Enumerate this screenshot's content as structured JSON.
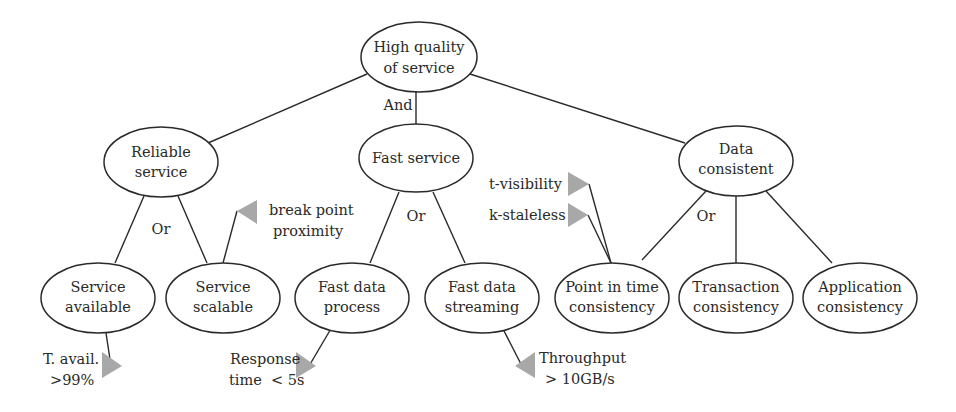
{
  "diagram": {
    "colors": {
      "stroke": "#2a2a2a",
      "flag": "#a8a8a8",
      "background": "#ffffff"
    },
    "nodes": {
      "root": {
        "lines": [
          "High quality",
          "of service"
        ]
      },
      "reliable": {
        "lines": [
          "Reliable",
          "service"
        ]
      },
      "fast": {
        "lines": [
          "Fast service"
        ]
      },
      "data": {
        "lines": [
          "Data",
          "consistent"
        ]
      },
      "available": {
        "lines": [
          "Service",
          "available"
        ]
      },
      "scalable": {
        "lines": [
          "Service",
          "scalable"
        ]
      },
      "fastproc": {
        "lines": [
          "Fast data",
          "process"
        ]
      },
      "faststream": {
        "lines": [
          "Fast data",
          "streaming"
        ]
      },
      "pit": {
        "lines": [
          "Point in time",
          "consistency"
        ]
      },
      "transaction": {
        "lines": [
          "Transaction",
          "consistency"
        ]
      },
      "application": {
        "lines": [
          "Application",
          "consistency"
        ]
      }
    },
    "operators": {
      "root": "And",
      "reliable": "Or",
      "fast": "Or",
      "data": "Or"
    },
    "metrics": {
      "availability": {
        "lines": [
          "T. avail.",
          ">99%"
        ]
      },
      "breakpoint": {
        "lines": [
          "break point",
          "proximity"
        ]
      },
      "response": {
        "lines": [
          "Response",
          "time  < 5s"
        ]
      },
      "throughput": {
        "lines": [
          "Throughput",
          "> 10GB/s"
        ]
      },
      "tvisibility": {
        "lines": [
          "t-visibility"
        ]
      },
      "kstaleless": {
        "lines": [
          "k-staleless"
        ]
      }
    }
  }
}
